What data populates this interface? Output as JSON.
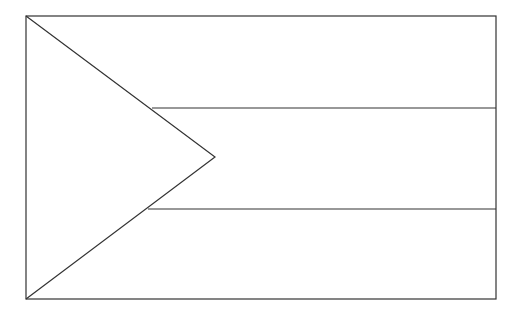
{
  "drawing": {
    "subject": "flag outline",
    "stroke_color": "#333333",
    "background_color": "#ffffff",
    "stroke_width": 1.2,
    "border": {
      "x1": 26,
      "y1": 16,
      "x2": 496,
      "y2": 299
    },
    "triangle": {
      "top": [
        26,
        16
      ],
      "apex": [
        215,
        157
      ],
      "bottom": [
        26,
        299
      ]
    },
    "stripe_lines": [
      {
        "x1": 152,
        "y": 108,
        "x2": 496
      },
      {
        "x1": 148,
        "y": 209,
        "x2": 496
      }
    ],
    "stripe_count": 3
  }
}
